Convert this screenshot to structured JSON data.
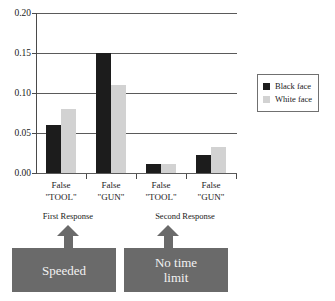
{
  "chart_data": {
    "type": "bar",
    "title": "",
    "xlabel": "",
    "ylabel": "",
    "ylim": [
      0.0,
      0.2
    ],
    "yticks": [
      "0.00",
      "0.05",
      "0.10",
      "0.15",
      "0.20"
    ],
    "ytick_values": [
      0.0,
      0.05,
      0.1,
      0.15,
      0.2
    ],
    "grid": true,
    "legend_position": "right",
    "categories": [
      "False\n\"TOOL\"",
      "False\n\"GUN\"",
      "False\n\"TOOL\"",
      "False\n\"GUN\""
    ],
    "category_lines": [
      [
        "False",
        "\"TOOL\""
      ],
      [
        "False",
        "\"GUN\""
      ],
      [
        "False",
        "\"TOOL\""
      ],
      [
        "False",
        "\"GUN\""
      ]
    ],
    "series": [
      {
        "name": "Black face",
        "color": "#1c1c1c",
        "values": [
          0.06,
          0.15,
          0.011,
          0.022
        ]
      },
      {
        "name": "White face",
        "color": "#d2d2d2",
        "values": [
          0.08,
          0.11,
          0.011,
          0.032
        ]
      }
    ],
    "annotations": [
      {
        "caption": "First Response",
        "box_label": "Speeded",
        "group_span": [
          0,
          1
        ]
      },
      {
        "caption": "Second Response",
        "box_label": "No time\nlimit",
        "group_span": [
          2,
          3
        ]
      }
    ]
  },
  "legend": {
    "items": [
      {
        "label": "Black face",
        "swatch": "#1c1c1c"
      },
      {
        "label": "White face",
        "swatch": "#d2d2d2"
      }
    ]
  },
  "annotations": {
    "first": {
      "caption": "First Response",
      "box_label": "Speeded"
    },
    "second": {
      "caption": "Second Response",
      "box_label_line1": "No time",
      "box_label_line2": "limit"
    }
  },
  "axis": {
    "y_tick_0": "0.00",
    "y_tick_1": "0.05",
    "y_tick_2": "0.10",
    "y_tick_3": "0.15",
    "y_tick_4": "0.20"
  },
  "categories": {
    "g0_l1": "False",
    "g0_l2": "\"TOOL\"",
    "g1_l1": "False",
    "g1_l2": "\"GUN\"",
    "g2_l1": "False",
    "g2_l2": "\"TOOL\"",
    "g3_l1": "False",
    "g3_l2": "\"GUN\""
  }
}
